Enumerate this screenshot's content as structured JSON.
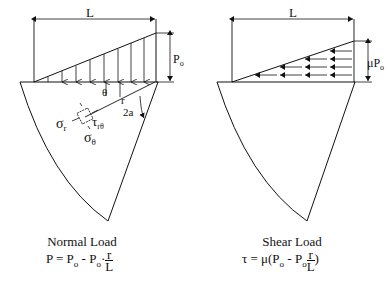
{
  "left_figure": {
    "dimension_label": "L",
    "load_label": "P",
    "load_label_sub": "o",
    "angle_theta": "θ",
    "radius_label": "r",
    "half_angle_label": "2a",
    "sigma_r": "σ",
    "sigma_r_sub": "r",
    "sigma_theta": "σ",
    "sigma_theta_sub": "θ",
    "tau": "τ",
    "tau_sub": "rθ",
    "caption_title": "Normal Load",
    "formula_lhs": "P = P",
    "formula_sub1": "o",
    "formula_mid": " - P",
    "formula_sub2": "o",
    "formula_dot": "·",
    "formula_num": "r",
    "formula_den": "L"
  },
  "right_figure": {
    "dimension_label": "L",
    "load_label": "μP",
    "load_label_sub": "o",
    "caption_title": "Shear Load",
    "formula_lhs": "τ = μ(P",
    "formula_sub1": "o",
    "formula_mid": " - P",
    "formula_sub2": "o",
    "formula_num": "r",
    "formula_den": "L",
    "formula_close": ")"
  }
}
